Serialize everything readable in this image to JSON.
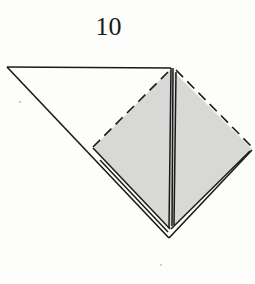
{
  "step": {
    "number": "10"
  },
  "diagram": {
    "colors": {
      "paper_white": "#fdfdfb",
      "paper_gray": "#d8d8d6",
      "line": "#1a1a1a"
    },
    "line_styles": {
      "dashed": "valley-fold",
      "solid": "edge"
    }
  }
}
